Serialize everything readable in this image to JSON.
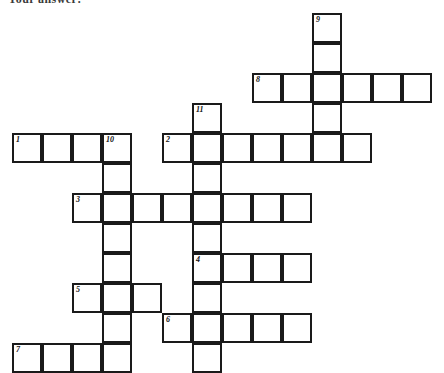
{
  "heading": {
    "text": "Your answer:"
  },
  "grid": {
    "cell_size": 30,
    "border_color": "#1a1a1a",
    "cell_fill": "#ffffff",
    "number_color": "#111111",
    "origin_x": 12,
    "origin_y": 13,
    "cells": [
      {
        "col": 10,
        "row": 0,
        "number": "9"
      },
      {
        "col": 10,
        "row": 1,
        "number": ""
      },
      {
        "col": 8,
        "row": 2,
        "number": "8"
      },
      {
        "col": 9,
        "row": 2,
        "number": ""
      },
      {
        "col": 10,
        "row": 2,
        "number": ""
      },
      {
        "col": 11,
        "row": 2,
        "number": ""
      },
      {
        "col": 12,
        "row": 2,
        "number": ""
      },
      {
        "col": 13,
        "row": 2,
        "number": ""
      },
      {
        "col": 10,
        "row": 3,
        "number": ""
      },
      {
        "col": 6,
        "row": 3,
        "number": "11"
      },
      {
        "col": 0,
        "row": 4,
        "number": "1"
      },
      {
        "col": 1,
        "row": 4,
        "number": ""
      },
      {
        "col": 2,
        "row": 4,
        "number": ""
      },
      {
        "col": 3,
        "row": 4,
        "number": "10"
      },
      {
        "col": 5,
        "row": 4,
        "number": "2"
      },
      {
        "col": 6,
        "row": 4,
        "number": ""
      },
      {
        "col": 7,
        "row": 4,
        "number": ""
      },
      {
        "col": 8,
        "row": 4,
        "number": ""
      },
      {
        "col": 9,
        "row": 4,
        "number": ""
      },
      {
        "col": 10,
        "row": 4,
        "number": ""
      },
      {
        "col": 11,
        "row": 4,
        "number": ""
      },
      {
        "col": 3,
        "row": 5,
        "number": ""
      },
      {
        "col": 6,
        "row": 5,
        "number": ""
      },
      {
        "col": 2,
        "row": 6,
        "number": "3"
      },
      {
        "col": 3,
        "row": 6,
        "number": ""
      },
      {
        "col": 4,
        "row": 6,
        "number": ""
      },
      {
        "col": 5,
        "row": 6,
        "number": ""
      },
      {
        "col": 6,
        "row": 6,
        "number": ""
      },
      {
        "col": 7,
        "row": 6,
        "number": ""
      },
      {
        "col": 8,
        "row": 6,
        "number": ""
      },
      {
        "col": 9,
        "row": 6,
        "number": ""
      },
      {
        "col": 3,
        "row": 7,
        "number": ""
      },
      {
        "col": 6,
        "row": 7,
        "number": ""
      },
      {
        "col": 3,
        "row": 8,
        "number": ""
      },
      {
        "col": 6,
        "row": 8,
        "number": "4"
      },
      {
        "col": 7,
        "row": 8,
        "number": ""
      },
      {
        "col": 8,
        "row": 8,
        "number": ""
      },
      {
        "col": 9,
        "row": 8,
        "number": ""
      },
      {
        "col": 2,
        "row": 9,
        "number": "5"
      },
      {
        "col": 3,
        "row": 9,
        "number": ""
      },
      {
        "col": 4,
        "row": 9,
        "number": ""
      },
      {
        "col": 6,
        "row": 9,
        "number": ""
      },
      {
        "col": 3,
        "row": 10,
        "number": ""
      },
      {
        "col": 5,
        "row": 10,
        "number": "6"
      },
      {
        "col": 6,
        "row": 10,
        "number": ""
      },
      {
        "col": 7,
        "row": 10,
        "number": ""
      },
      {
        "col": 8,
        "row": 10,
        "number": ""
      },
      {
        "col": 9,
        "row": 10,
        "number": ""
      },
      {
        "col": 0,
        "row": 11,
        "number": "7"
      },
      {
        "col": 1,
        "row": 11,
        "number": ""
      },
      {
        "col": 2,
        "row": 11,
        "number": ""
      },
      {
        "col": 3,
        "row": 11,
        "number": ""
      },
      {
        "col": 6,
        "row": 11,
        "number": ""
      }
    ],
    "entries": {
      "across": [
        "1",
        "2",
        "3",
        "4",
        "5",
        "6",
        "7",
        "8"
      ],
      "down": [
        "9",
        "10",
        "11"
      ]
    }
  }
}
